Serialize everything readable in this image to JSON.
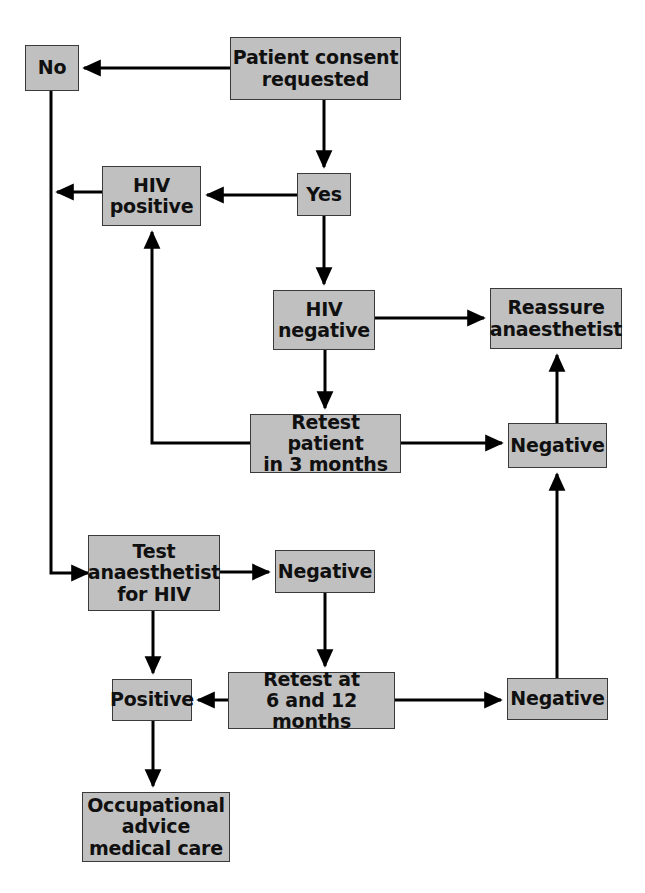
{
  "diagram": {
    "style": {
      "node_fill": "#c0c0c0",
      "node_border": "#3a3a3a",
      "edge_color": "#000000",
      "background": "#ffffff"
    },
    "nodes": [
      {
        "id": "no",
        "label": "No",
        "x": 25,
        "y": 45,
        "w": 54,
        "h": 46
      },
      {
        "id": "consent",
        "label": "Patient consent\nrequested",
        "x": 230,
        "y": 37,
        "w": 171,
        "h": 63
      },
      {
        "id": "hiv_positive",
        "label": "HIV\npositive",
        "x": 102,
        "y": 166,
        "w": 99,
        "h": 60
      },
      {
        "id": "yes",
        "label": "Yes",
        "x": 297,
        "y": 173,
        "w": 54,
        "h": 43
      },
      {
        "id": "hiv_negative",
        "label": "HIV\nnegative",
        "x": 273,
        "y": 290,
        "w": 102,
        "h": 60
      },
      {
        "id": "reassure",
        "label": "Reassure\nanaesthetist",
        "x": 490,
        "y": 288,
        "w": 132,
        "h": 61
      },
      {
        "id": "retest_3m",
        "label": "Retest patient\nin 3 months",
        "x": 250,
        "y": 414,
        "w": 151,
        "h": 59
      },
      {
        "id": "negative_mid",
        "label": "Negative",
        "x": 508,
        "y": 423,
        "w": 99,
        "h": 45
      },
      {
        "id": "test_anaes",
        "label": "Test\nanaesthetist\nfor HIV",
        "x": 88,
        "y": 535,
        "w": 132,
        "h": 76
      },
      {
        "id": "negative_top2",
        "label": "Negative",
        "x": 275,
        "y": 550,
        "w": 100,
        "h": 43
      },
      {
        "id": "positive",
        "label": "Positive",
        "x": 112,
        "y": 679,
        "w": 80,
        "h": 42
      },
      {
        "id": "retest_612",
        "label": "Retest at\n6 and 12 months",
        "x": 228,
        "y": 672,
        "w": 167,
        "h": 57
      },
      {
        "id": "negative_bot",
        "label": "Negative",
        "x": 507,
        "y": 678,
        "w": 101,
        "h": 42
      },
      {
        "id": "occupational",
        "label": "Occupational\nadvice\nmedical care",
        "x": 82,
        "y": 792,
        "w": 148,
        "h": 70
      }
    ],
    "edges": [
      {
        "id": "consent-to-no",
        "from": "consent",
        "to": "no",
        "points": "230,68 84,68",
        "arrow": "end"
      },
      {
        "id": "consent-to-yes",
        "from": "consent",
        "to": "yes",
        "points": "324,100 324,167",
        "arrow": "end"
      },
      {
        "id": "yes-to-hivpositive",
        "from": "yes",
        "to": "hiv_positive",
        "points": "297,195 207,195",
        "arrow": "end"
      },
      {
        "id": "hivpositive-to-left-line",
        "from": "hiv_positive",
        "to": "no",
        "points": "102,192 57,192",
        "arrow": "end"
      },
      {
        "id": "no-down-left-rail",
        "from": "no",
        "to": "test_anaes",
        "points": "51,91 51,573 88,573",
        "arrow": "end"
      },
      {
        "id": "yes-to-hivnegative",
        "from": "yes",
        "to": "hiv_negative",
        "points": "324,216 324,284",
        "arrow": "end"
      },
      {
        "id": "hivnegative-to-reassure",
        "from": "hiv_negative",
        "to": "reassure",
        "points": "375,318 484,318",
        "arrow": "end"
      },
      {
        "id": "hivnegative-to-retest3m",
        "from": "hiv_negative",
        "to": "retest_3m",
        "points": "325,350 325,408",
        "arrow": "end"
      },
      {
        "id": "retest3m-to-hivpositive",
        "from": "retest_3m",
        "to": "hiv_positive",
        "points": "250,443 152,443 152,232",
        "arrow": "end"
      },
      {
        "id": "retest3m-to-negativemid",
        "from": "retest_3m",
        "to": "negative_mid",
        "points": "401,443 502,443",
        "arrow": "end"
      },
      {
        "id": "negativemid-to-reassure",
        "from": "negative_mid",
        "to": "reassure",
        "points": "557,423 557,355",
        "arrow": "end"
      },
      {
        "id": "testanaes-to-negativetop2",
        "from": "test_anaes",
        "to": "negative_top2",
        "points": "220,572 269,572",
        "arrow": "end"
      },
      {
        "id": "testanaes-to-positive",
        "from": "test_anaes",
        "to": "positive",
        "points": "153,611 153,673",
        "arrow": "end"
      },
      {
        "id": "negativetop2-to-retest612",
        "from": "negative_top2",
        "to": "retest_612",
        "points": "325,593 325,666",
        "arrow": "end"
      },
      {
        "id": "retest612-to-positive",
        "from": "retest_612",
        "to": "positive",
        "points": "228,700 198,700",
        "arrow": "end"
      },
      {
        "id": "retest612-to-negativebot",
        "from": "retest_612",
        "to": "negative_bot",
        "points": "395,700 501,700",
        "arrow": "end"
      },
      {
        "id": "negativebot-to-negativemid",
        "from": "negative_bot",
        "to": "negative_mid",
        "points": "557,678 557,474",
        "arrow": "end"
      },
      {
        "id": "positive-to-occupational",
        "from": "positive",
        "to": "occupational",
        "points": "153,721 153,786",
        "arrow": "end"
      }
    ]
  }
}
